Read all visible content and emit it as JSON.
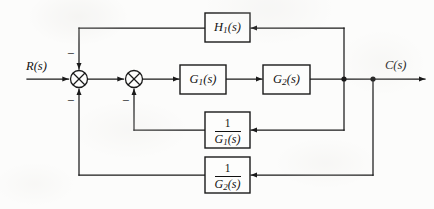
{
  "diagram": {
    "type": "control-system-block-diagram",
    "line_color": "#1a1a1a",
    "background_color": "#fcfcfb",
    "input": {
      "label": "R(s)",
      "name": "reference-input"
    },
    "output": {
      "label": "C(s)",
      "name": "controlled-output"
    },
    "blocks": [
      {
        "id": "H1",
        "label": "H",
        "sub": "1",
        "arg": "(s)",
        "kind": "transfer-function",
        "x": 205,
        "y": 13,
        "w": 45,
        "h": 29
      },
      {
        "id": "G1",
        "label": "G",
        "sub": "1",
        "arg": "(s)",
        "kind": "transfer-function",
        "x": 180,
        "y": 65,
        "w": 46,
        "h": 29
      },
      {
        "id": "G2",
        "label": "G",
        "sub": "2",
        "arg": "(s)",
        "kind": "transfer-function",
        "x": 263,
        "y": 65,
        "w": 47,
        "h": 29
      },
      {
        "id": "inv_G1",
        "numerator": "1",
        "denominator_label": "G",
        "denominator_sub": "1",
        "denominator_arg": "(s)",
        "kind": "inverse-transfer-function",
        "x": 205,
        "y": 112,
        "w": 45,
        "h": 36
      },
      {
        "id": "inv_G2",
        "numerator": "1",
        "denominator_label": "G",
        "denominator_sub": "2",
        "denominator_arg": "(s)",
        "kind": "inverse-transfer-function",
        "x": 205,
        "y": 157,
        "w": 45,
        "h": 36
      }
    ],
    "summing_junctions": [
      {
        "id": "sum1",
        "cx": 79,
        "cy": 79,
        "r": 8.5,
        "signs": [
          {
            "text": "−",
            "position": "top-left",
            "x": 67,
            "y": 49
          },
          {
            "text": "−",
            "position": "bottom-left",
            "x": 67,
            "y": 95
          }
        ]
      },
      {
        "id": "sum2",
        "cx": 134,
        "cy": 79,
        "r": 8.5,
        "signs": [
          {
            "text": "−",
            "position": "bottom-left",
            "x": 122,
            "y": 95
          }
        ]
      }
    ],
    "nodes": [
      {
        "id": "tap_inner",
        "x": 344,
        "y": 79
      },
      {
        "id": "tap_outer",
        "x": 373,
        "y": 79
      }
    ],
    "signal_paths": [
      {
        "from": "R(s)",
        "to": "sum1",
        "direction": "right"
      },
      {
        "from": "sum1",
        "to": "sum2",
        "direction": "right"
      },
      {
        "from": "sum2",
        "to": "G1",
        "direction": "right"
      },
      {
        "from": "G1",
        "to": "G2",
        "direction": "right"
      },
      {
        "from": "G2",
        "to": "C(s)",
        "direction": "right"
      },
      {
        "from": "tap_inner",
        "to": "H1",
        "direction": "up-then-left"
      },
      {
        "from": "H1",
        "to": "sum1",
        "direction": "left-then-down"
      },
      {
        "from": "tap_inner",
        "to": "inv_G1",
        "direction": "down-then-left"
      },
      {
        "from": "inv_G1",
        "to": "sum2",
        "direction": "left-then-up"
      },
      {
        "from": "tap_outer",
        "to": "inv_G2",
        "direction": "down-then-left"
      },
      {
        "from": "inv_G2",
        "to": "sum1",
        "direction": "left-then-up"
      }
    ]
  }
}
